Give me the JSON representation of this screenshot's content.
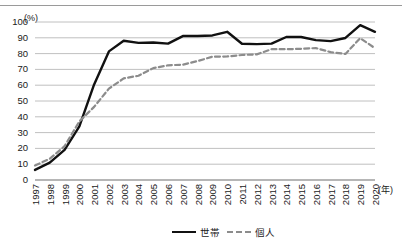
{
  "chart_data": {
    "type": "line",
    "title": "",
    "subtitle": "",
    "xlabel": "年",
    "ylabel": "(%)",
    "ylim": [
      0,
      100
    ],
    "ytick_step": 10,
    "grid": true,
    "legend_position": "bottom-center",
    "x": [
      "1997",
      "1998",
      "1999",
      "2000",
      "2001",
      "2002",
      "2003",
      "2004",
      "2005",
      "2006",
      "2007",
      "2008",
      "2009",
      "2010",
      "2011",
      "2012",
      "2013",
      "2014",
      "2015",
      "2016",
      "2017",
      "2018",
      "2019",
      "2020"
    ],
    "categories": [
      "1997",
      "1998",
      "1999",
      "2000",
      "2001",
      "2002",
      "2003",
      "2004",
      "2005",
      "2006",
      "2007",
      "2008",
      "2009",
      "2010",
      "2011",
      "2012",
      "2013",
      "2014",
      "2015",
      "2016",
      "2017",
      "2018",
      "2019",
      "2020"
    ],
    "yticks": [
      "0",
      "10",
      "20",
      "30",
      "40",
      "50",
      "60",
      "70",
      "80",
      "90",
      "100"
    ],
    "series": [
      {
        "name": "世帯",
        "style": "solid",
        "color": "#111111",
        "values": [
          6.4,
          11.0,
          19.1,
          34.0,
          60.5,
          81.4,
          88.1,
          86.8,
          87.0,
          86.3,
          91.1,
          91.1,
          91.5,
          93.8,
          86.2,
          86.0,
          86.3,
          90.5,
          90.5,
          88.5,
          87.9,
          89.9,
          98.0,
          93.8
        ]
      },
      {
        "name": "個人",
        "style": "dashed",
        "color": "#8c8c8c",
        "values": [
          9.2,
          13.4,
          21.4,
          37.1,
          46.3,
          57.8,
          64.3,
          66.0,
          70.8,
          72.6,
          73.0,
          75.3,
          78.0,
          78.2,
          79.1,
          79.5,
          82.8,
          82.8,
          83.0,
          83.5,
          80.9,
          79.8,
          89.8,
          83.4
        ]
      }
    ]
  },
  "axes": {
    "unit_label": "(%)",
    "x_unit_label": "(年)"
  },
  "legend": {
    "items": [
      {
        "label": "世帯",
        "style": "solid"
      },
      {
        "label": "個人",
        "style": "dashed"
      }
    ]
  }
}
